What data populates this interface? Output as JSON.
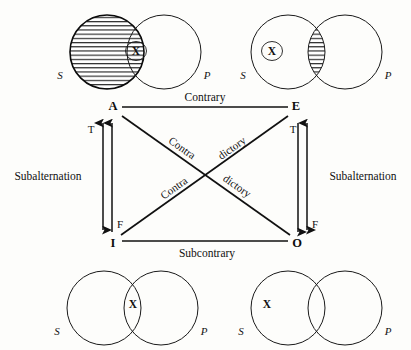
{
  "figure": {
    "background_color": "#fdfdfb",
    "ink_color": "#111111"
  },
  "square": {
    "corners": [
      {
        "id": "A",
        "label": "A",
        "x": 113,
        "y": 110
      },
      {
        "id": "E",
        "label": "E",
        "x": 296,
        "y": 110
      },
      {
        "id": "I",
        "label": "I",
        "x": 113,
        "y": 243
      },
      {
        "id": "O",
        "label": "O",
        "x": 297,
        "y": 243
      }
    ],
    "relations": {
      "top": "Contrary",
      "bottom": "Subcontrary",
      "left_side": "Subalternation",
      "right_side": "Subalternation",
      "diagonal_part_one": "Contra",
      "diagonal_part_two": "dictory"
    },
    "truth_values": {
      "top_left": "T",
      "top_right": "T",
      "bottom_left": "F",
      "bottom_right": "F"
    }
  },
  "venns": [
    {
      "id": "top-left",
      "position": "top-left",
      "proposition": "A",
      "left_label": "S",
      "right_label": "P",
      "shading": "s-only-and-overlap-hatched",
      "x_mark": "X",
      "x_circled": true,
      "x_region": "overlap"
    },
    {
      "id": "top-right",
      "position": "top-right",
      "proposition": "E",
      "left_label": "S",
      "right_label": "P",
      "shading": "overlap-hatched",
      "x_mark": "X",
      "x_circled": true,
      "x_region": "s-only"
    },
    {
      "id": "bottom-left",
      "position": "bottom-left",
      "proposition": "I",
      "left_label": "S",
      "right_label": "P",
      "shading": "none",
      "x_mark": "X",
      "x_circled": false,
      "x_region": "overlap"
    },
    {
      "id": "bottom-right",
      "position": "bottom-right",
      "proposition": "O",
      "left_label": "S",
      "right_label": "P",
      "shading": "none",
      "x_mark": "X",
      "x_circled": false,
      "x_region": "s-only"
    }
  ]
}
